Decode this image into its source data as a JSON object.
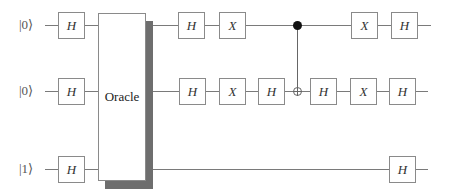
{
  "circuit": {
    "qubits": [
      {
        "label": "|0⟩",
        "y": 25,
        "wire_start": 45,
        "wire_end": 431
      },
      {
        "label": "|0⟩",
        "y": 91,
        "wire_start": 45,
        "wire_end": 428
      },
      {
        "label": "|1⟩",
        "y": 169,
        "wire_start": 45,
        "wire_end": 428
      }
    ],
    "oracle": {
      "label": "Oracle",
      "x": 98,
      "y": 13,
      "width": 48,
      "height": 168,
      "shadow_offset_x": 7,
      "shadow_offset_y": 8
    },
    "gates": [
      {
        "qubit": 0,
        "symbol": "H",
        "x": 58
      },
      {
        "qubit": 1,
        "symbol": "H",
        "x": 58
      },
      {
        "qubit": 2,
        "symbol": "H",
        "x": 58
      },
      {
        "qubit": 0,
        "symbol": "H",
        "x": 178
      },
      {
        "qubit": 0,
        "symbol": "X",
        "x": 219
      },
      {
        "qubit": 0,
        "symbol": "X",
        "x": 351
      },
      {
        "qubit": 0,
        "symbol": "H",
        "x": 391
      },
      {
        "qubit": 1,
        "symbol": "H",
        "x": 179
      },
      {
        "qubit": 1,
        "symbol": "X",
        "x": 219
      },
      {
        "qubit": 1,
        "symbol": "H",
        "x": 258
      },
      {
        "qubit": 1,
        "symbol": "H",
        "x": 310
      },
      {
        "qubit": 1,
        "symbol": "X",
        "x": 350
      },
      {
        "qubit": 1,
        "symbol": "H",
        "x": 389
      },
      {
        "qubit": 2,
        "symbol": "H",
        "x": 389
      }
    ],
    "cnot": {
      "control_qubit": 0,
      "target_qubit": 1,
      "x": 297
    }
  }
}
